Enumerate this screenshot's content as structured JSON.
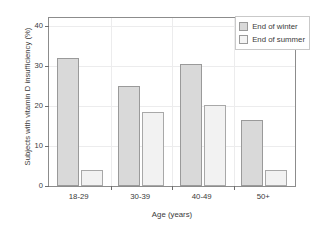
{
  "chart_data": {
    "type": "bar",
    "title": "",
    "xlabel": "Age (years)",
    "ylabel": "Subjects with vitamin D insufficiency (%)",
    "categories": [
      "18-29",
      "30-39",
      "40-49",
      "50+"
    ],
    "series": [
      {
        "name": "End of winter",
        "color": "#d9d9d9",
        "values": [
          31.9,
          25.0,
          30.6,
          16.6
        ]
      },
      {
        "name": "End of summer",
        "color": "#f2f2f2",
        "values": [
          4.1,
          18.6,
          20.2,
          4.0
        ]
      }
    ],
    "ylim": [
      0,
      42
    ],
    "yticks": [
      0,
      10,
      20,
      30,
      40
    ],
    "ytick_labels": [
      "0",
      "10",
      "20",
      "30",
      "40"
    ],
    "grid": true,
    "legend_position": "top-right",
    "legend": [
      "End of winter",
      "End of summer"
    ]
  }
}
